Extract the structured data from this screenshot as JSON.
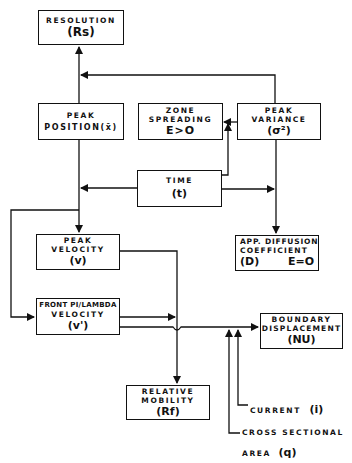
{
  "nodes": {
    "resolution": {
      "title": "RESOLUTION",
      "symbol": "(Rs)"
    },
    "peak_position": {
      "title": "PEAK",
      "line2": "POSITION(x̄)"
    },
    "zone_spreading": {
      "title": "ZONE",
      "line2": "SPREADING",
      "condition": "E>O"
    },
    "peak_variance": {
      "title": "PEAK",
      "line2": "VARIANCE",
      "symbol": "(σ²)"
    },
    "time": {
      "title": "TIME",
      "symbol": "(t)"
    },
    "peak_velocity": {
      "title": "PEAK",
      "line2": "VELOCITY",
      "symbol": "(v)"
    },
    "app_diffusion": {
      "title": "APP. DIFFUSION",
      "line2": "COEFFICIENT",
      "symbol": "(D)",
      "condition": "E=O"
    },
    "front_velocity": {
      "title": "FRONT PI/LAMBDA",
      "line2": "VELOCITY",
      "symbol": "(v')"
    },
    "boundary_displacement": {
      "title": "BOUNDARY",
      "line2": "DISPLACEMENT",
      "symbol": "(NU)"
    },
    "relative_mobility": {
      "title": "RELATIVE",
      "line2": "MOBILITY",
      "symbol": "(Rf)"
    }
  },
  "inputs": {
    "current": {
      "label": "CURRENT",
      "symbol": "(i)"
    },
    "cross_section": {
      "label": "CROSS SECTIONAL",
      "line2": "AREA",
      "symbol": "(q)"
    }
  },
  "edges": [
    {
      "from": "peak_position",
      "to": "resolution"
    },
    {
      "from": "peak_variance",
      "to": "resolution"
    },
    {
      "from": "peak_variance",
      "to": "zone_spreading"
    },
    {
      "from": "time",
      "to": "zone_spreading"
    },
    {
      "from": "time",
      "to": "peak_position"
    },
    {
      "from": "time",
      "to": "app_diffusion"
    },
    {
      "from": "peak_variance",
      "to": "app_diffusion"
    },
    {
      "from": "peak_position",
      "to": "peak_velocity"
    },
    {
      "from": "time",
      "to": "front_velocity"
    },
    {
      "from": "peak_velocity",
      "to": "relative_mobility"
    },
    {
      "from": "front_velocity",
      "to": "relative_mobility"
    },
    {
      "from": "front_velocity",
      "to": "boundary_displacement"
    },
    {
      "from": "current",
      "to": "boundary_displacement"
    },
    {
      "from": "cross_section",
      "to": "boundary_displacement"
    }
  ]
}
